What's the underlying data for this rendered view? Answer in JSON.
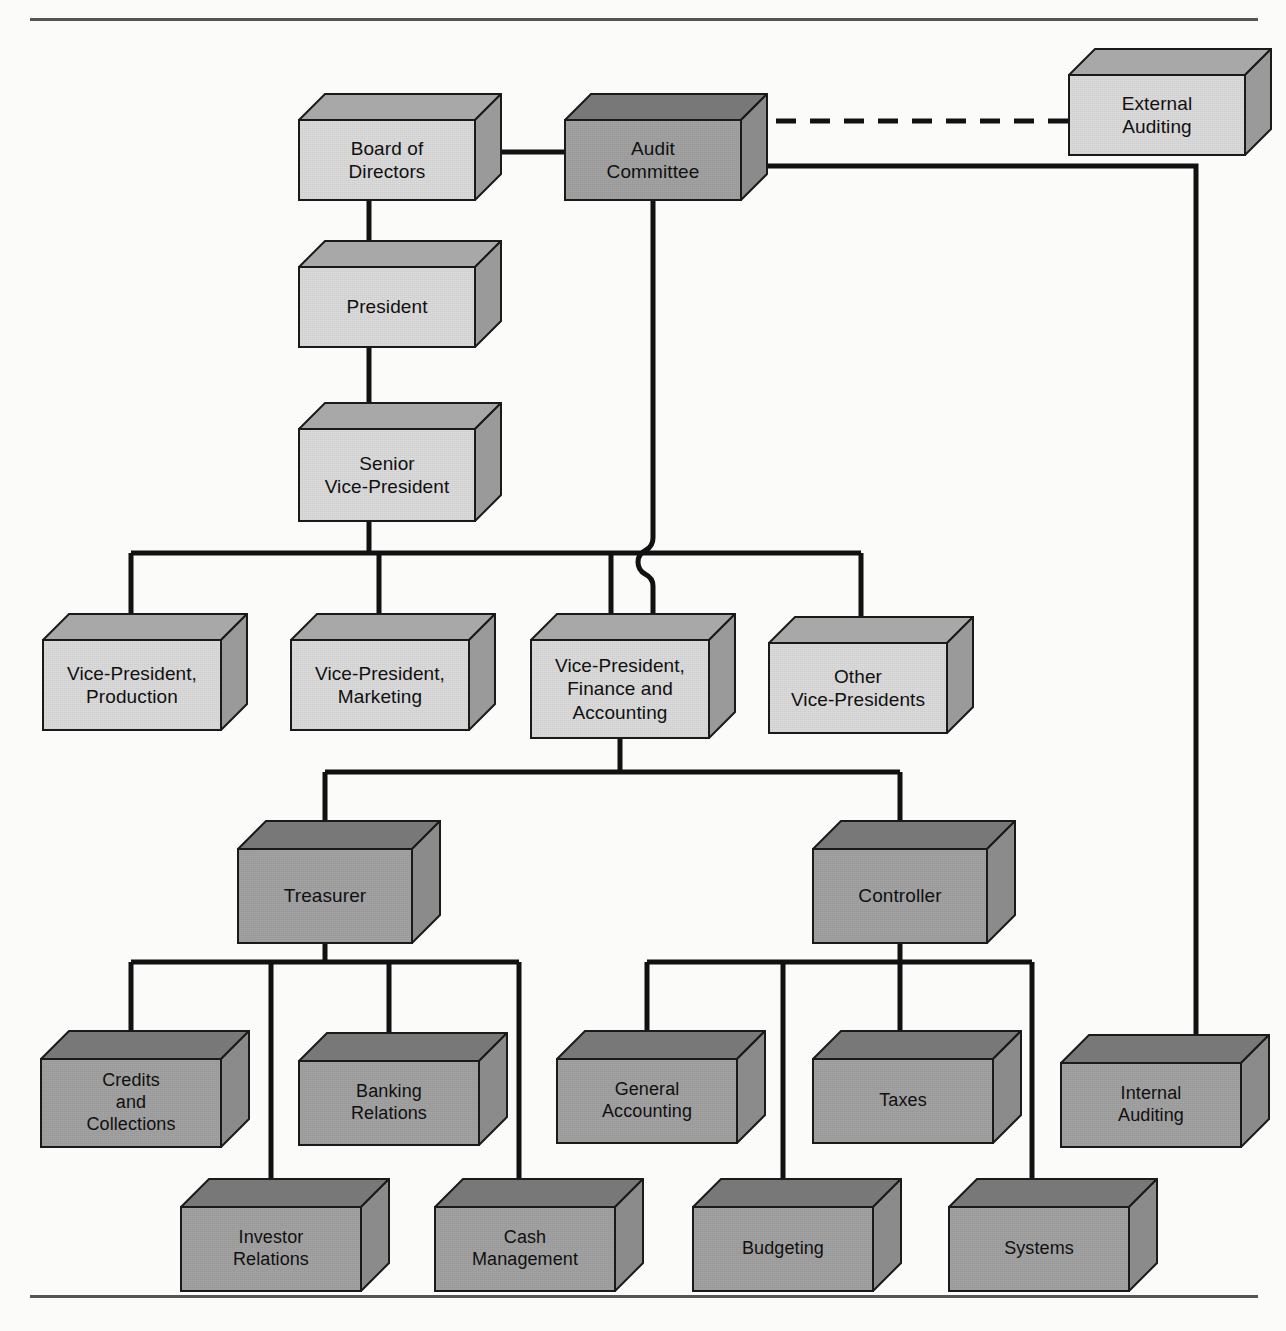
{
  "figure": {
    "type": "organization-chart",
    "top_rule": true,
    "bottom_rule": true,
    "background_color": "#fbfbfa",
    "line_color": "#111111"
  },
  "style": {
    "light_face": "#dcdcdc",
    "light_top": "#a8a8a8",
    "light_side": "#9a9a9a",
    "dark_face": "#a3a3a3",
    "dark_top": "#787878",
    "dark_side": "#8b8b8b",
    "outline": "#1a1a1a"
  },
  "nodes": [
    {
      "id": "board",
      "label": "Board of\nDirectors",
      "shade": "light",
      "x": 298,
      "y": 93,
      "w": 178,
      "h": 82,
      "depth": 26,
      "font": 19
    },
    {
      "id": "audit_committee",
      "label": "Audit\nCommittee",
      "shade": "dark",
      "x": 564,
      "y": 93,
      "w": 178,
      "h": 82,
      "depth": 26,
      "font": 19
    },
    {
      "id": "external_audit",
      "label": "External\nAuditing",
      "shade": "light",
      "x": 1068,
      "y": 48,
      "w": 178,
      "h": 82,
      "depth": 26,
      "font": 19
    },
    {
      "id": "president",
      "label": "President",
      "shade": "light",
      "x": 298,
      "y": 240,
      "w": 178,
      "h": 82,
      "depth": 26,
      "font": 19
    },
    {
      "id": "svp",
      "label": "Senior\nVice-President",
      "shade": "light",
      "x": 298,
      "y": 402,
      "w": 178,
      "h": 94,
      "depth": 26,
      "font": 19
    },
    {
      "id": "vp_production",
      "label": "Vice-President,\nProduction",
      "shade": "light",
      "x": 42,
      "y": 613,
      "w": 180,
      "h": 92,
      "depth": 26,
      "font": 19
    },
    {
      "id": "vp_marketing",
      "label": "Vice-President,\nMarketing",
      "shade": "light",
      "x": 290,
      "y": 613,
      "w": 180,
      "h": 92,
      "depth": 26,
      "font": 19
    },
    {
      "id": "vp_finance",
      "label": "Vice-President,\nFinance and\nAccounting",
      "shade": "light",
      "x": 530,
      "y": 613,
      "w": 180,
      "h": 100,
      "depth": 26,
      "font": 19
    },
    {
      "id": "vp_other",
      "label": "Other\nVice-Presidents",
      "shade": "light",
      "x": 768,
      "y": 616,
      "w": 180,
      "h": 92,
      "depth": 26,
      "font": 19
    },
    {
      "id": "treasurer",
      "label": "Treasurer",
      "shade": "dark",
      "x": 237,
      "y": 820,
      "w": 176,
      "h": 96,
      "depth": 28,
      "font": 19
    },
    {
      "id": "controller",
      "label": "Controller",
      "shade": "dark",
      "x": 812,
      "y": 820,
      "w": 176,
      "h": 96,
      "depth": 28,
      "font": 19
    },
    {
      "id": "credits",
      "label": "Credits\nand\nCollections",
      "shade": "dark",
      "x": 40,
      "y": 1030,
      "w": 182,
      "h": 90,
      "depth": 28,
      "font": 18
    },
    {
      "id": "banking",
      "label": "Banking\nRelations",
      "shade": "dark",
      "x": 298,
      "y": 1032,
      "w": 182,
      "h": 86,
      "depth": 28,
      "font": 18
    },
    {
      "id": "general_acct",
      "label": "General\nAccounting",
      "shade": "dark",
      "x": 556,
      "y": 1030,
      "w": 182,
      "h": 86,
      "depth": 28,
      "font": 18
    },
    {
      "id": "taxes",
      "label": "Taxes",
      "shade": "dark",
      "x": 812,
      "y": 1030,
      "w": 182,
      "h": 86,
      "depth": 28,
      "font": 18
    },
    {
      "id": "internal_audit",
      "label": "Internal\nAuditing",
      "shade": "dark",
      "x": 1060,
      "y": 1034,
      "w": 182,
      "h": 86,
      "depth": 28,
      "font": 18
    },
    {
      "id": "investor",
      "label": "Investor\nRelations",
      "shade": "dark",
      "x": 180,
      "y": 1178,
      "w": 182,
      "h": 86,
      "depth": 28,
      "font": 18
    },
    {
      "id": "cash_mgmt",
      "label": "Cash\nManagement",
      "shade": "dark",
      "x": 434,
      "y": 1178,
      "w": 182,
      "h": 86,
      "depth": 28,
      "font": 18
    },
    {
      "id": "budgeting",
      "label": "Budgeting",
      "shade": "dark",
      "x": 692,
      "y": 1178,
      "w": 182,
      "h": 86,
      "depth": 28,
      "font": 18
    },
    {
      "id": "systems",
      "label": "Systems",
      "shade": "dark",
      "x": 948,
      "y": 1178,
      "w": 182,
      "h": 86,
      "depth": 28,
      "font": 18
    }
  ],
  "edges": [
    {
      "id": "board-audit",
      "from": "board",
      "to": "audit_committee",
      "style": "solid",
      "path": "M 502,152 L 564,152"
    },
    {
      "id": "audit-external",
      "from": "audit_committee",
      "to": "external_audit",
      "style": "dashed",
      "path": "M 742,121 L 1068,121"
    },
    {
      "id": "audit-internal",
      "from": "audit_committee",
      "to": "internal_audit",
      "style": "solid",
      "path": "M 742,166 L 1196,166 L 1196,1040"
    },
    {
      "id": "board-president",
      "from": "board",
      "to": "president",
      "style": "solid",
      "path": "M 369,175 L 369,266"
    },
    {
      "id": "president-svp",
      "from": "president",
      "to": "svp",
      "style": "solid",
      "path": "M 369,322 L 369,428"
    },
    {
      "id": "svp-bus",
      "from": "svp",
      "to": "vp-row",
      "style": "solid",
      "path": "M 369,496 L 369,553 M 131,553 L 861,553 M 131,553 L 131,639 M 379,553 L 379,639 M 611,553 L 611,639 M 861,553 L 861,642"
    },
    {
      "id": "audit-vpfinance",
      "from": "audit_committee",
      "to": "vp_finance",
      "style": "solid",
      "path": "M 653,175 L 653,538 q 0,8 -7,12 -8,4 -8,12 0,8 7,12 8,4 8,12 L 653,639"
    },
    {
      "id": "vpfinance-bus",
      "from": "vp_finance",
      "to": "treas-ctrl",
      "style": "solid",
      "path": "M 620,713 L 620,772 M 325,772 L 900,772 M 325,772 L 325,846 M 900,772 L 900,846"
    },
    {
      "id": "treasurer-bus",
      "from": "treasurer",
      "to": "treasurer-children",
      "style": "solid",
      "path": "M 325,916 L 325,962 M 131,962 L 519,962 M 131,962 L 131,1056 M 271,962 L 271,1204 M 389,962 L 389,1058 M 519,962 L 519,1204"
    },
    {
      "id": "controller-bus",
      "from": "controller",
      "to": "controller-children",
      "style": "solid",
      "path": "M 900,916 L 900,962 M 647,962 L 1032,962 M 647,962 L 647,1056 M 783,962 L 783,1204 M 900,962 L 900,1056 M 1032,962 L 1032,1204"
    }
  ],
  "legend": {
    "dashed_relationship": "External Auditing reports to the Audit Committee (dashed line)",
    "solid_relationship": "Solid lines indicate direct reporting relationships"
  }
}
